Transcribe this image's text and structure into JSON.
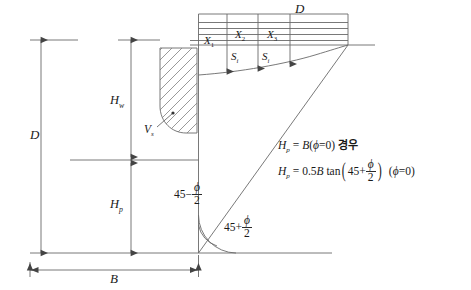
{
  "figure": {
    "title_semantic": "bearing-capacity-settlement-diagram",
    "stroke_color": "#555555",
    "text_color": "#1a1a1a"
  },
  "dimensions": {
    "depth_left": "D",
    "depth_top_right": "D",
    "width_bottom": "B",
    "water_height": "H",
    "water_height_sub": "w",
    "passive_height": "H",
    "passive_height_sub": "p"
  },
  "pressure_labels": {
    "x1": "X",
    "x1_sub": "1",
    "x2": "X",
    "x2_sub": "2",
    "x3": "X",
    "x3_sub": "3",
    "s1": "S",
    "s1_sub": "i",
    "s2": "S",
    "s2_sub": "i",
    "volume": "V",
    "volume_sub": "s"
  },
  "angles": {
    "upper_prefix": "45",
    "upper_operator": "−",
    "upper_num": "ϕ",
    "upper_den": "2",
    "lower_prefix": "45",
    "lower_operator": "+",
    "lower_num": "ϕ",
    "lower_den": "2"
  },
  "equations": {
    "line1": {
      "lhs": "H",
      "lhs_sub": "p",
      "eq": "=",
      "rhs": "B",
      "paren_open": "(",
      "phi": "ϕ",
      "phi_eq": "=",
      "phi_val": "0",
      "paren_close": ")",
      "note": "경우"
    },
    "line2": {
      "lhs": "H",
      "lhs_sub": "p",
      "eq": "=",
      "coef": "0.5",
      "b": "B",
      "tan": "tan",
      "inner_prefix": "45",
      "inner_operator": "+",
      "inner_num": "ϕ",
      "inner_den": "2",
      "cond_open": "(",
      "cond_phi": "ϕ",
      "cond_eq": "=",
      "cond_val": "0",
      "cond_close": ")"
    }
  }
}
